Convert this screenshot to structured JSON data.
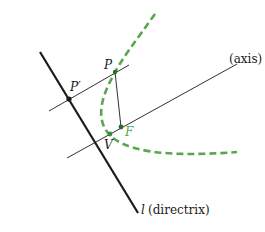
{
  "diagram": {
    "type": "parabola-construction",
    "colors": {
      "ink": "#1a1a1a",
      "curve": "#5aa64f",
      "focus_label": "#5aa64f",
      "background": "#ffffff"
    },
    "labels": {
      "P": "P",
      "P_prime": "P′",
      "F": "F",
      "V": "V",
      "axis": "(axis)",
      "directrix_l": "l",
      "directrix": "(directrix)"
    },
    "elements": {
      "directrix_line": "l (directrix)",
      "axis_line": "axis",
      "parabola": "dashed green parabola",
      "points": [
        "P",
        "P′",
        "F",
        "V"
      ]
    }
  }
}
